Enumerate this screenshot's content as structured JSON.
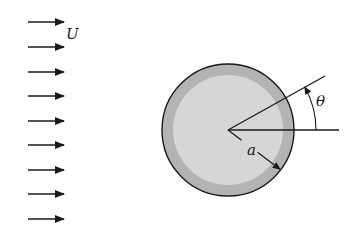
{
  "diagram": {
    "flow": {
      "label": "U",
      "arrow_count": 9,
      "arrow_x_start": 28,
      "arrow_x_end": 64,
      "arrow_y": [
        22,
        47,
        72,
        96,
        121,
        145,
        170,
        194,
        219
      ],
      "label_pos": [
        66,
        39
      ]
    },
    "cylinder": {
      "center": [
        228,
        130
      ],
      "radius": 66,
      "inner_radius": 55,
      "ring_color": "#b3b3b3",
      "fill_color": "#d6d6d6",
      "outline_color": "#1a1a1a"
    },
    "radius_label": {
      "text": "a",
      "pos": [
        247,
        155
      ]
    },
    "angle": {
      "label": "θ",
      "label_pos": [
        316,
        106
      ],
      "ray_end": [
        325,
        76
      ],
      "reference_end": [
        339,
        130
      ],
      "arc_radius": 88
    },
    "colors": {
      "line": "#1a1a1a",
      "background": "#ffffff"
    }
  }
}
